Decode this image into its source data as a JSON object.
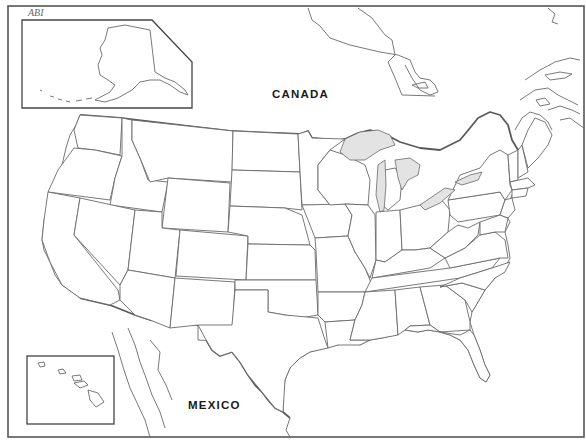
{
  "map": {
    "title": "Outline map of the United States",
    "labels": {
      "canada": "CANADA",
      "mexico": "MEXICO"
    },
    "insets": [
      {
        "name": "Alaska"
      },
      {
        "name": "Hawaii"
      }
    ],
    "scan_mark": "ABI",
    "colors": {
      "background": "#ffffff",
      "outline": "#6a6a6a",
      "lakes": "#e3e3e3",
      "label": "#1a1a1a"
    }
  }
}
